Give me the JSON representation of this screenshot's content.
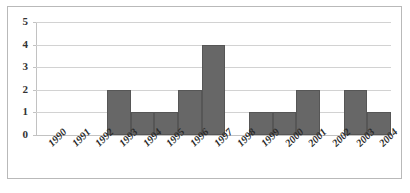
{
  "chart_data": {
    "type": "bar",
    "title": "",
    "subtitle": "",
    "xlabel": "",
    "ylabel": "",
    "categories": [
      "1990",
      "1991",
      "1992",
      "1993",
      "1994",
      "1995",
      "1996",
      "1997",
      "1998",
      "1999",
      "2000",
      "2001",
      "2002",
      "2003",
      "2004"
    ],
    "values": [
      0,
      0,
      0,
      2,
      1,
      1,
      2,
      4,
      0,
      1,
      1,
      2,
      0,
      2,
      1
    ],
    "ylim": [
      0,
      5
    ],
    "yticks": [
      "5",
      "4",
      "3",
      "2",
      "1",
      "0"
    ],
    "ytick_values": [
      5,
      4,
      3,
      2,
      1,
      0
    ],
    "grid": true,
    "legend": false,
    "legend_position": "none",
    "bar_color": "#676767",
    "bar_border_color": "#565656",
    "gridline_color": "#d2d2d2",
    "axis_color": "#c2c2c2",
    "frame_color": "#b9b9b9",
    "background_color": "#ffffff",
    "xlabel_rotation": -45
  }
}
